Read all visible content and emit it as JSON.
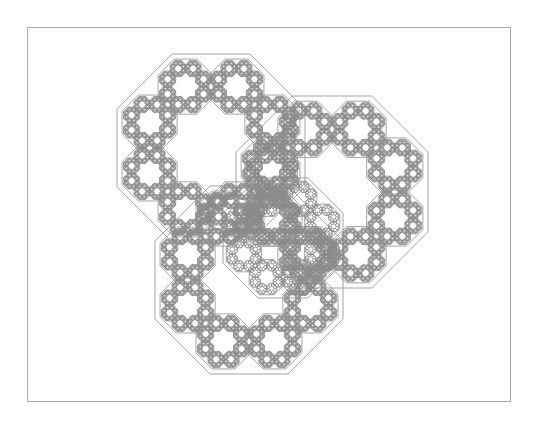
{
  "figure": {
    "frame": {
      "x": 27,
      "y": 27,
      "width": 484,
      "height": 375,
      "color": "#a8a8a8"
    },
    "stroke_color": "#8c8c8c",
    "fill_color": "#ffffff",
    "depth": 4,
    "octagons": [
      {
        "name": "top-left",
        "cx": 211,
        "cy": 148,
        "half": 94
      },
      {
        "name": "right",
        "cx": 332,
        "cy": 192,
        "half": 96
      },
      {
        "name": "bottom",
        "cx": 249,
        "cy": 280,
        "half": 94
      },
      {
        "name": "center",
        "cx": 283,
        "cy": 238,
        "half": 60
      }
    ]
  }
}
